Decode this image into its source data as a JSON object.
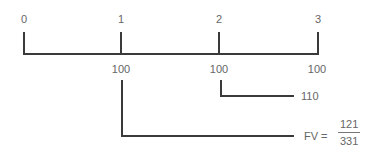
{
  "timeline": {
    "periods": [
      "0",
      "1",
      "2",
      "3"
    ],
    "cash_flows": [
      "100",
      "100",
      "100"
    ]
  },
  "compounding": {
    "from_period_2_value": "110",
    "fv_label": "FV =",
    "fv_numerator": "121",
    "fv_denominator": "331"
  },
  "colors": {
    "line": "#3a3a3a",
    "text": "#666666"
  }
}
